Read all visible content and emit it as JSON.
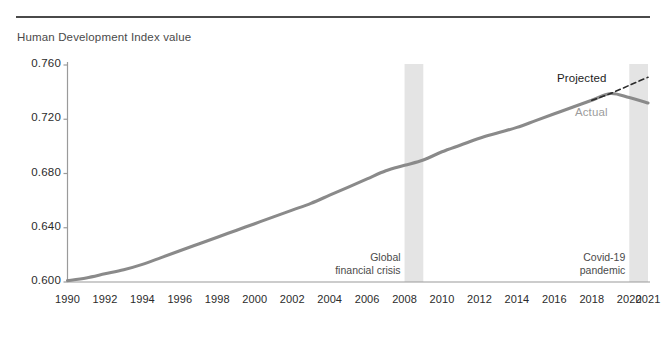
{
  "page": {
    "cut_off_line": "",
    "axis_title": "Human Development Index value"
  },
  "annotations": {
    "projected": "Projected",
    "actual": "Actual",
    "crisis_line1": "Global",
    "crisis_line2": "financial crisis",
    "covid_line1": "Covid-19",
    "covid_line2": "pandemic"
  },
  "colors": {
    "line": "#8a8a8a",
    "projection": "#2b2b2b",
    "band": "#e4e4e4",
    "axis": "#9a9a9a",
    "rule": "#4a4a4a",
    "text": "#2b2b2b",
    "muted": "#9c9c9c"
  },
  "chart_data": {
    "type": "line",
    "title": "",
    "subtitle": "",
    "xlabel": "",
    "ylabel": "Human Development Index value",
    "ylim": [
      0.6,
      0.76
    ],
    "xlim": [
      1990,
      2021
    ],
    "grid": false,
    "legend": "inline-annotations",
    "ytick_labels": [
      "0.760",
      "0.720",
      "0.680",
      "0.640",
      "0.600"
    ],
    "yticks": [
      0.76,
      0.72,
      0.68,
      0.64,
      0.6
    ],
    "xtick_labels": [
      "1990",
      "1992",
      "1994",
      "1996",
      "1998",
      "2000",
      "2002",
      "2004",
      "2006",
      "2008",
      "2010",
      "2012",
      "2014",
      "2016",
      "2018",
      "2020",
      "2021"
    ],
    "xticks": [
      1990,
      1992,
      1994,
      1996,
      1998,
      2000,
      2002,
      2004,
      2006,
      2008,
      2010,
      2012,
      2014,
      2016,
      2018,
      2020,
      2021
    ],
    "series": [
      {
        "name": "Actual",
        "style": "solid",
        "color": "#8a8a8a",
        "x": [
          1990,
          1991,
          1992,
          1993,
          1994,
          1995,
          1996,
          1997,
          1998,
          1999,
          2000,
          2001,
          2002,
          2003,
          2004,
          2005,
          2006,
          2007,
          2008,
          2009,
          2010,
          2011,
          2012,
          2013,
          2014,
          2015,
          2016,
          2017,
          2018,
          2019,
          2020,
          2021
        ],
        "y": [
          0.601,
          0.603,
          0.606,
          0.609,
          0.613,
          0.618,
          0.623,
          0.628,
          0.633,
          0.638,
          0.643,
          0.648,
          0.653,
          0.658,
          0.664,
          0.67,
          0.676,
          0.682,
          0.686,
          0.69,
          0.696,
          0.701,
          0.706,
          0.71,
          0.714,
          0.719,
          0.724,
          0.729,
          0.734,
          0.739,
          0.736,
          0.732
        ]
      },
      {
        "name": "Projected",
        "style": "dashed",
        "color": "#2b2b2b",
        "x": [
          2018,
          2019,
          2020,
          2021
        ],
        "y": [
          0.734,
          0.739,
          0.745,
          0.751
        ]
      }
    ],
    "shaded_bands": [
      {
        "label": "Global financial crisis",
        "x_start": 2008,
        "x_end": 2009
      },
      {
        "label": "Covid-19 pandemic",
        "x_start": 2020,
        "x_end": 2021
      }
    ]
  }
}
